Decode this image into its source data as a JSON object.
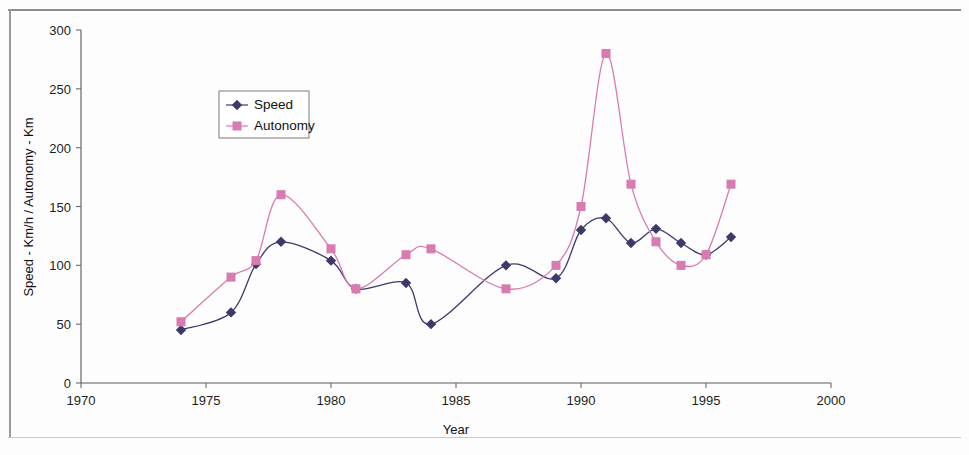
{
  "chart_data": {
    "type": "line",
    "title": "",
    "xlabel": "Year",
    "ylabel": "Speed - Km/h / Autonomy - Km",
    "xlim": [
      1970,
      2000
    ],
    "ylim": [
      0,
      300
    ],
    "xticks": [
      1970,
      1975,
      1980,
      1985,
      1990,
      1995,
      2000
    ],
    "yticks": [
      0,
      50,
      100,
      150,
      200,
      250,
      300
    ],
    "grid": false,
    "legend_position": "upper-left-inside",
    "x": [
      1974,
      1976,
      1977,
      1978,
      1980,
      1981,
      1983,
      1984,
      1987,
      1989,
      1990,
      1991,
      1992,
      1993,
      1994,
      1995,
      1996
    ],
    "series": [
      {
        "name": "Speed",
        "color": "#3d3a6b",
        "marker": "diamond",
        "values": [
          45,
          60,
          101,
          120,
          104,
          80,
          85,
          50,
          100,
          89,
          130,
          140,
          119,
          131,
          119,
          109,
          124
        ]
      },
      {
        "name": "Autonomy",
        "color": "#d87bb0",
        "marker": "square",
        "values": [
          52,
          90,
          104,
          160,
          114,
          80,
          109,
          114,
          80,
          100,
          150,
          280,
          169,
          120,
          100,
          109,
          169
        ]
      }
    ]
  },
  "legend": {
    "entries": [
      {
        "label": "Speed"
      },
      {
        "label": "Autonomy"
      }
    ]
  },
  "axes": {
    "x_title": "Year",
    "y_title": "Speed - Km/h / Autonomy - Km",
    "x_tick_labels": [
      "1970",
      "1975",
      "1980",
      "1985",
      "1990",
      "1995",
      "2000"
    ],
    "y_tick_labels": [
      "0",
      "50",
      "100",
      "150",
      "200",
      "250",
      "300"
    ]
  },
  "colors": {
    "speed": "#3d3a6b",
    "autonomy": "#d87bb0",
    "axis": "#5a5a5a",
    "frame": "#8d8d8d",
    "background": "#fdfdfd"
  }
}
